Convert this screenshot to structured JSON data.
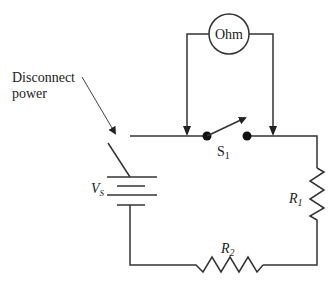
{
  "diagram": {
    "type": "circuit",
    "labels": {
      "disconnect_line1": "Disconnect",
      "disconnect_line2": "power",
      "meter": "Ohm",
      "switch_main": "S",
      "switch_sub": "1",
      "source_main": "V",
      "source_sub": "S",
      "r1_main": "R",
      "r1_sub": "1",
      "r2_main": "R",
      "r2_sub": "2"
    },
    "components": [
      {
        "id": "Vs",
        "kind": "battery"
      },
      {
        "id": "disconnect",
        "kind": "open-switch",
        "annotation": "Disconnect power"
      },
      {
        "id": "S1",
        "kind": "switch"
      },
      {
        "id": "Ohm",
        "kind": "ohmmeter",
        "connected_across": "S1"
      },
      {
        "id": "R1",
        "kind": "resistor"
      },
      {
        "id": "R2",
        "kind": "resistor"
      }
    ]
  }
}
